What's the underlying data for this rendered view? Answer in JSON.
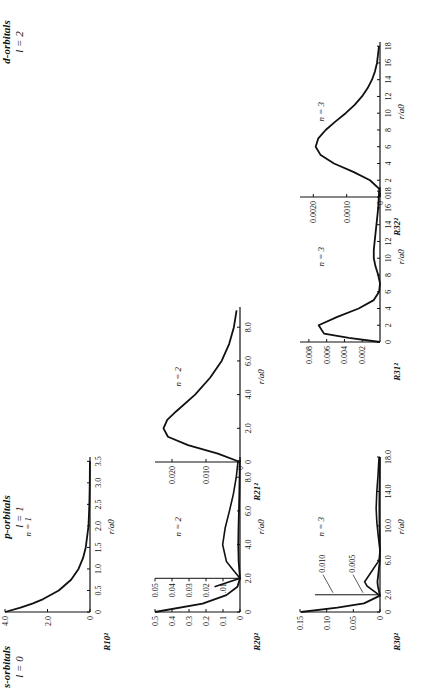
{
  "figure": {
    "columns": [
      {
        "title": "s-orbitals",
        "subtitle": "l = 0"
      },
      {
        "title": "p-orbitals",
        "subtitle": "l = 1"
      },
      {
        "title": "d-orbitals",
        "subtitle": "l = 2"
      }
    ]
  },
  "chart_data": [
    {
      "type": "line",
      "id": "R10",
      "title": "n = 1",
      "ylabel": "R10²",
      "xlabel": "r/a0",
      "xticks": [
        "0",
        "0.5",
        "1.0",
        "1.5",
        "2.0",
        "2.5",
        "3.0",
        "3.5"
      ],
      "xlim": [
        0,
        3.6
      ],
      "yticks": [
        "0",
        "2.0",
        "4.0"
      ],
      "ylim": [
        0,
        4.0
      ],
      "x": [
        0,
        0.1,
        0.2,
        0.3,
        0.5,
        0.75,
        1.0,
        1.25,
        1.5,
        2.0,
        2.5,
        3.0,
        3.5
      ],
      "y": [
        4.0,
        3.27,
        2.68,
        2.2,
        1.47,
        0.89,
        0.54,
        0.33,
        0.2,
        0.07,
        0.03,
        0.01,
        0.004
      ]
    },
    {
      "type": "line",
      "id": "R20",
      "title": "n = 2",
      "ylabel": "R20²",
      "xlabel": "r/a0",
      "xticks": [
        "0",
        "2.0",
        "4.0",
        "6.0",
        "8.0"
      ],
      "xlim": [
        0,
        9.2
      ],
      "yticks": [
        "0",
        "0.1",
        "0.2",
        "0.3",
        "0.4",
        "0.5"
      ],
      "ylim": [
        0,
        0.5
      ],
      "inset_yticks": [
        ".01",
        "0.02",
        "0.03",
        "0.04",
        "0.05"
      ],
      "inset_ylim": [
        0,
        0.05
      ],
      "x": [
        0,
        0.5,
        1.0,
        1.5,
        2.0,
        2.5,
        3.0,
        4.0,
        5.0,
        6.0,
        7.0,
        8.0,
        9.0
      ],
      "y": [
        0.5,
        0.22,
        0.08,
        0.015,
        0,
        0.004,
        0.008,
        0.0102,
        0.0087,
        0.0062,
        0.0039,
        0.0022,
        0.0011
      ]
    },
    {
      "type": "line",
      "id": "R30",
      "title": "n = 3",
      "ylabel": "R30²",
      "xlabel": "r/a0",
      "xticks": [
        "0",
        "2.0",
        "6.0",
        "10.0",
        "14.0",
        "18.0"
      ],
      "xlim": [
        0,
        18
      ],
      "yticks": [
        "0",
        "0.05",
        "0.10",
        "0.15"
      ],
      "ylim": [
        0,
        0.15
      ],
      "annotations": [
        "0.010",
        "0.005"
      ],
      "x": [
        0,
        0.5,
        1.0,
        1.9,
        3.0,
        3.5,
        4.5,
        6.0,
        7.1,
        9,
        10.5,
        12,
        14,
        16,
        18
      ],
      "y": [
        0.148,
        0.08,
        0.03,
        0,
        0.004,
        0.0048,
        0.003,
        0.0003,
        0,
        0.0006,
        0.001,
        0.0012,
        0.001,
        0.0006,
        0.0003
      ]
    },
    {
      "type": "line",
      "id": "R21",
      "title": "n = 2",
      "ylabel": "R21²",
      "xlabel": "r/a0",
      "xticks": [
        "0",
        "2.0",
        "4.0",
        "6.0",
        "8.0"
      ],
      "xlim": [
        0,
        9.2
      ],
      "yticks": [
        "0",
        "0.010",
        "0.020"
      ],
      "ylim": [
        0,
        0.025
      ],
      "x": [
        0,
        0.5,
        1.0,
        1.5,
        2.0,
        2.5,
        3.0,
        4.0,
        5.0,
        6.0,
        7.0,
        8.0,
        9.0
      ],
      "y": [
        0,
        0.0065,
        0.0153,
        0.0212,
        0.0225,
        0.0214,
        0.0188,
        0.0132,
        0.0088,
        0.0054,
        0.0032,
        0.0018,
        0.001
      ]
    },
    {
      "type": "line",
      "id": "R31",
      "title": "n = 3",
      "ylabel": "R31²",
      "xlabel": "r/a0",
      "xticks": [
        "0",
        "2",
        "4",
        "6",
        "8",
        "10",
        "12",
        "14",
        "16",
        "18"
      ],
      "xlim": [
        0,
        18.5
      ],
      "yticks": [
        "0.002",
        "0.004",
        "0.006",
        "0.008"
      ],
      "ylim": [
        0,
        0.009
      ],
      "x": [
        0,
        0.5,
        1.0,
        2.0,
        3.0,
        4.0,
        5.0,
        6.0,
        7.0,
        8.0,
        9.0,
        10.0,
        11.0,
        12.0,
        14.0,
        16.0,
        18.0
      ],
      "y": [
        0,
        0.0035,
        0.0063,
        0.0069,
        0.0048,
        0.0024,
        0.0007,
        0.0001,
        0,
        0.0002,
        0.0005,
        0.0007,
        0.0007,
        0.0006,
        0.0004,
        0.0002,
        0.0001
      ]
    },
    {
      "type": "line",
      "id": "R32",
      "title": "n = 3",
      "ylabel": "R32²",
      "xlabel": "r/a0",
      "xticks": [
        "0",
        "2",
        "4",
        "6",
        "8",
        "10",
        "12",
        "14",
        "16",
        "18"
      ],
      "xlim": [
        0,
        18.5
      ],
      "yticks": [
        "0",
        "0.0010",
        "0.0020"
      ],
      "ylim": [
        0,
        0.0024
      ],
      "x": [
        0,
        1,
        2,
        3,
        4,
        5,
        6,
        7,
        8,
        9,
        10,
        11,
        12,
        13,
        14,
        15,
        16,
        17,
        18
      ],
      "y": [
        0,
        3e-05,
        0.0003,
        0.0008,
        0.00138,
        0.00178,
        0.00193,
        0.00185,
        0.00163,
        0.00134,
        0.00103,
        0.00076,
        0.00054,
        0.00037,
        0.00024,
        0.00015,
        9e-05,
        6e-05,
        3e-05
      ]
    }
  ]
}
